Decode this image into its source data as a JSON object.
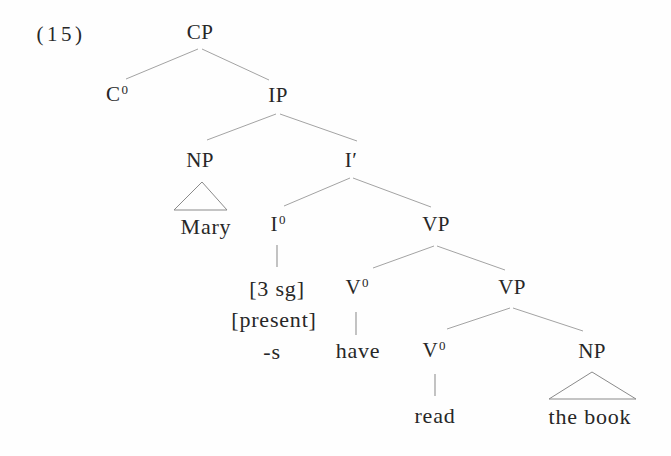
{
  "figure": {
    "number_label": "(15)",
    "colors": {
      "text": "#272727",
      "branch_line": "#a3a3a3",
      "triangle_line": "#8a8a8a",
      "background": "#fefefe"
    }
  },
  "tree": {
    "nodes": {
      "cp": {
        "label": "CP",
        "sup": ""
      },
      "c0": {
        "label": "C",
        "sup": "0"
      },
      "ip": {
        "label": "IP",
        "sup": ""
      },
      "np_subject": {
        "label": "NP",
        "sup": ""
      },
      "i_bar": {
        "label": "I′",
        "sup": ""
      },
      "i0": {
        "label": "I",
        "sup": "0"
      },
      "vp_upper": {
        "label": "VP",
        "sup": ""
      },
      "v0_aux": {
        "label": "V",
        "sup": "0"
      },
      "vp_lower": {
        "label": "VP",
        "sup": ""
      },
      "v0_main": {
        "label": "V",
        "sup": "0"
      },
      "np_object": {
        "label": "NP",
        "sup": ""
      }
    },
    "terminals": {
      "subject": "Mary",
      "i0_feature_person": "[3 sg]",
      "i0_feature_tense": "[present]",
      "i0_affix": "-s",
      "aux_verb": "have",
      "main_verb": "read",
      "object": "the book"
    }
  }
}
